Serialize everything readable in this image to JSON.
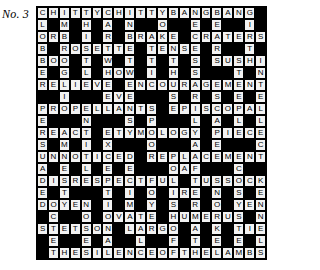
{
  "header": {
    "puzzle_number": "No. 3"
  },
  "crossword": {
    "columns": 21,
    "rows": 21,
    "block_color": "#000000",
    "cell_color": "#f2f2f2",
    "text_color": "#000000",
    "grid": [
      [
        "C",
        "H",
        "I",
        "T",
        "T",
        "Y",
        "C",
        "H",
        "I",
        "T",
        "T",
        "Y",
        "B",
        "A",
        "N",
        "G",
        "B",
        "A",
        "N",
        "G",
        ""
      ],
      [
        "L",
        "",
        "M",
        "",
        "H",
        "",
        "A",
        "",
        "N",
        "",
        "",
        "O",
        "",
        "",
        "E",
        "",
        "E",
        "",
        "",
        "I",
        ""
      ],
      [
        "O",
        "R",
        "B",
        "",
        "I",
        "",
        "R",
        "",
        "B",
        "R",
        "A",
        "K",
        "E",
        "",
        "C",
        "R",
        "A",
        "T",
        "E",
        "R",
        "S"
      ],
      [
        "B",
        "",
        "R",
        "O",
        "S",
        "E",
        "T",
        "T",
        "E",
        "",
        "T",
        "E",
        "N",
        "S",
        "E",
        "",
        "R",
        "",
        "",
        "T",
        ""
      ],
      [
        "B",
        "O",
        "O",
        "",
        "T",
        "",
        "W",
        "",
        "T",
        "",
        "T",
        "",
        "T",
        "",
        "S",
        "",
        "S",
        "U",
        "S",
        "H",
        "I"
      ],
      [
        "E",
        "",
        "G",
        "",
        "L",
        "",
        "H",
        "O",
        "W",
        "",
        "I",
        "",
        "H",
        "",
        "S",
        "",
        "",
        "",
        "T",
        "",
        "N"
      ],
      [
        "R",
        "E",
        "L",
        "I",
        "E",
        "V",
        "E",
        "",
        "E",
        "N",
        "C",
        "O",
        "U",
        "R",
        "A",
        "G",
        "E",
        "M",
        "E",
        "N",
        "T"
      ],
      [
        "",
        "",
        "I",
        "",
        "",
        "",
        "E",
        "V",
        "E",
        "",
        "",
        "",
        "S",
        "",
        "R",
        "",
        "S",
        "",
        "E",
        "",
        "E"
      ],
      [
        "P",
        "R",
        "O",
        "P",
        "E",
        "L",
        "L",
        "A",
        "N",
        "T",
        "S",
        "",
        "E",
        "P",
        "I",
        "S",
        "C",
        "O",
        "P",
        "A",
        "L"
      ],
      [
        "E",
        "",
        "",
        "",
        "N",
        "",
        "",
        "",
        "S",
        "",
        "P",
        "",
        "",
        "",
        "L",
        "",
        "A",
        "",
        "L",
        "",
        "L"
      ],
      [
        "R",
        "E",
        "A",
        "C",
        "T",
        "",
        "E",
        "T",
        "Y",
        "M",
        "O",
        "L",
        "O",
        "G",
        "Y",
        "",
        "P",
        "I",
        "E",
        "C",
        "E"
      ],
      [
        "S",
        "",
        "M",
        "",
        "I",
        "",
        "X",
        "",
        "",
        "",
        "O",
        "",
        "",
        "",
        "A",
        "",
        "E",
        "",
        "",
        "",
        "C"
      ],
      [
        "U",
        "N",
        "N",
        "O",
        "T",
        "I",
        "C",
        "E",
        "D",
        "",
        "R",
        "E",
        "P",
        "L",
        "A",
        "C",
        "E",
        "M",
        "E",
        "N",
        "T"
      ],
      [
        "A",
        "",
        "E",
        "",
        "L",
        "",
        "E",
        "",
        "E",
        "",
        "",
        "",
        "O",
        "A",
        "F",
        "",
        "",
        "",
        "C",
        "",
        ""
      ],
      [
        "D",
        "I",
        "S",
        "R",
        "E",
        "S",
        "P",
        "E",
        "C",
        "T",
        "F",
        "U",
        "L",
        "",
        "T",
        "U",
        "S",
        "S",
        "O",
        "C",
        "K"
      ],
      [
        "E",
        "",
        "T",
        "",
        "",
        "",
        "T",
        "",
        "I",
        "",
        "O",
        "",
        "I",
        "R",
        "E",
        "",
        "N",
        "",
        "S",
        "",
        "E"
      ],
      [
        "D",
        "O",
        "Y",
        "E",
        "N",
        "",
        "I",
        "",
        "M",
        "",
        "Y",
        "",
        "S",
        "",
        "R",
        "",
        "O",
        "",
        "Y",
        "E",
        "N"
      ],
      [
        "",
        "C",
        "",
        "",
        "O",
        "",
        "O",
        "V",
        "A",
        "T",
        "E",
        "",
        "H",
        "U",
        "M",
        "E",
        "R",
        "U",
        "S",
        "",
        "N"
      ],
      [
        "S",
        "T",
        "E",
        "T",
        "S",
        "O",
        "N",
        "",
        "L",
        "A",
        "R",
        "G",
        "O",
        "",
        "A",
        "",
        "K",
        "",
        "T",
        "I",
        "E"
      ],
      [
        "",
        "E",
        "",
        "",
        "E",
        "",
        "A",
        "",
        "",
        "L",
        "",
        "",
        "F",
        "",
        "T",
        "",
        "E",
        "",
        "E",
        "",
        "L"
      ],
      [
        "",
        "T",
        "H",
        "E",
        "S",
        "I",
        "L",
        "E",
        "N",
        "C",
        "E",
        "O",
        "F",
        "T",
        "H",
        "E",
        "L",
        "A",
        "M",
        "B",
        "S"
      ]
    ]
  }
}
